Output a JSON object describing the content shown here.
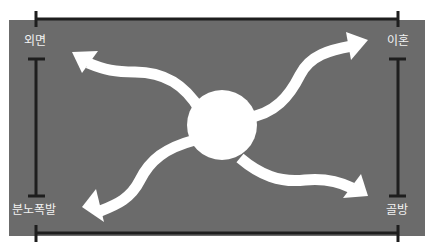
{
  "diagram": {
    "background_color": "#6b6b6b",
    "line_color": "#1e1e1e",
    "arrow_color": "#ffffff",
    "center": {
      "shape": "circle",
      "color": "#ffffff"
    },
    "labels": {
      "top_left": "외면",
      "top_right": "이혼",
      "bottom_left": "분노폭발",
      "bottom_right": "골방"
    },
    "arrows": [
      {
        "name": "arrow-to-top-left",
        "direction": "top-left",
        "target": "외면"
      },
      {
        "name": "arrow-to-top-right",
        "direction": "top-right",
        "target": "이혼"
      },
      {
        "name": "arrow-to-bottom-left",
        "direction": "bottom-left",
        "target": "분노폭발"
      },
      {
        "name": "arrow-to-bottom-right",
        "direction": "bottom-right",
        "target": "골방"
      }
    ]
  }
}
